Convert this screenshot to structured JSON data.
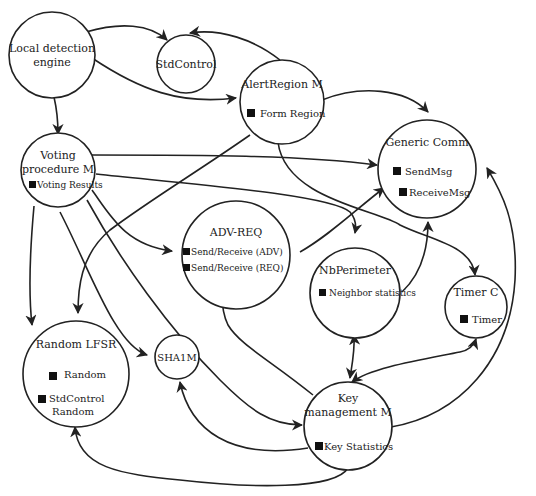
{
  "diagram": {
    "nodes": {
      "local_detection": {
        "title_1": "Local detection",
        "title_2": "engine"
      },
      "stdcontrol": {
        "title": "StdControl"
      },
      "alertregion": {
        "title": "AlertRegion M",
        "items": [
          "Form Region"
        ]
      },
      "genericcomm": {
        "title": "Generic Comm",
        "items": [
          "SendMsg",
          "ReceiveMsg"
        ]
      },
      "voting": {
        "title_1": "Voting",
        "title_2": "procedure M",
        "items": [
          "Voting Results"
        ]
      },
      "advreq": {
        "title": "ADV-REQ",
        "items": [
          "Send/Receive (ADV)",
          "Send/Receive (REQ)"
        ]
      },
      "nbperimeter": {
        "title": "NbPerimeter",
        "items": [
          "Neighbor statistics"
        ]
      },
      "timerc": {
        "title": "Timer C",
        "items": [
          "Timer"
        ]
      },
      "randomlfsr": {
        "title": "Random LFSR",
        "items": [
          "Random",
          "StdControl",
          "Random"
        ]
      },
      "sha1m": {
        "title": "SHA1M"
      },
      "keymgmt": {
        "title_1": "Key",
        "title_2": "management M",
        "items": [
          "Key Statistics"
        ]
      }
    },
    "edges": [
      {
        "from": "Local detection engine",
        "to": "StdControl"
      },
      {
        "from": "Local detection engine",
        "to": "AlertRegion M"
      },
      {
        "from": "Local detection engine",
        "to": "Voting procedure M"
      },
      {
        "from": "AlertRegion M",
        "to": "StdControl"
      },
      {
        "from": "AlertRegion M",
        "to": "Generic Comm"
      },
      {
        "from": "AlertRegion M",
        "to": "Random LFSR"
      },
      {
        "from": "AlertRegion M",
        "to": "Timer C"
      },
      {
        "from": "Voting procedure M",
        "to": "Generic Comm"
      },
      {
        "from": "Voting procedure M",
        "to": "ADV-REQ"
      },
      {
        "from": "Voting procedure M",
        "to": "NbPerimeter"
      },
      {
        "from": "Voting procedure M",
        "to": "Random LFSR"
      },
      {
        "from": "Voting procedure M",
        "to": "SHA1M"
      },
      {
        "from": "Voting procedure M",
        "to": "Key management M"
      },
      {
        "from": "ADV-REQ",
        "to": "Generic Comm"
      },
      {
        "from": "NbPerimeter",
        "to": "Generic Comm"
      },
      {
        "from": "Key management M",
        "to": "NbPerimeter",
        "bidirectional": true
      },
      {
        "from": "Key management M",
        "to": "Timer C",
        "bidirectional": true
      },
      {
        "from": "Key management M",
        "to": "ADV-REQ"
      },
      {
        "from": "Key management M",
        "to": "SHA1M"
      },
      {
        "from": "Key management M",
        "to": "Random LFSR"
      },
      {
        "from": "Key management M",
        "to": "Generic Comm"
      }
    ]
  }
}
